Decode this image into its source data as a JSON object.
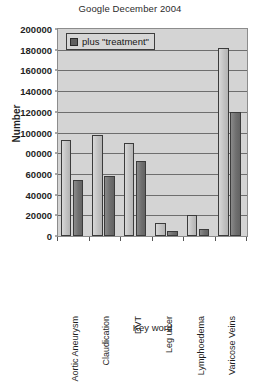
{
  "chart_data": {
    "type": "bar",
    "title": "Google December 2004",
    "xlabel": "Key word",
    "ylabel": "Number",
    "ylim": [
      0,
      200000
    ],
    "ytick_step": 20000,
    "ytick_labels": [
      "200000",
      "180000",
      "160000",
      "140000",
      "120000",
      "100000",
      "00000",
      "60000",
      "40000",
      "20000",
      "0"
    ],
    "ytick_values": [
      200000,
      180000,
      160000,
      140000,
      120000,
      100000,
      80000,
      60000,
      40000,
      20000,
      0
    ],
    "grid": true,
    "legend_position": "top-left",
    "legend": [
      "plus \"treatment\""
    ],
    "categories": [
      "Aortic Aneurysm",
      "Claudication",
      "DVT",
      "Leg ulcer",
      "Lymphoedema",
      "Varicose Veins"
    ],
    "series": [
      {
        "name": "keyword",
        "values": [
          93000,
          98000,
          90000,
          13000,
          20000,
          182000
        ]
      },
      {
        "name": "plus \"treatment\"",
        "values": [
          54000,
          58000,
          72000,
          5000,
          7000,
          120000
        ]
      }
    ]
  },
  "legend": {
    "swatch_color": "#5f5f5f",
    "label": "plus \"treatment\""
  },
  "colors": {
    "plot_background": "#d4d4d4",
    "gridline": "#6e6e6e",
    "bar_light": "#c6c6c6",
    "bar_dark": "#777777",
    "axis": "#555555"
  }
}
